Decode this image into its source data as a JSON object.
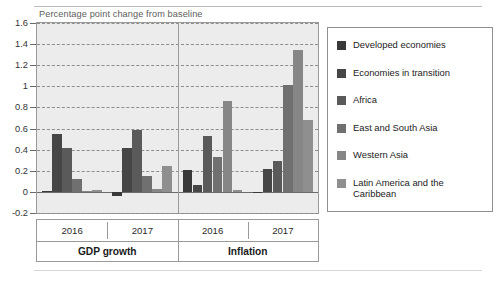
{
  "axis_title": "Percentage point change from baseline",
  "chart_data": {
    "type": "bar",
    "title": "Percentage point change from baseline",
    "xlabel": "",
    "ylabel": "Percentage point change from baseline",
    "ylim": [
      -0.2,
      1.6
    ],
    "ytick_values": [
      1.6,
      1.4,
      1.2,
      1,
      0.8,
      0.6,
      0.4,
      0.2,
      0,
      -0.2
    ],
    "ytick_labels": [
      "1.6",
      "1.4",
      "1.2",
      "1",
      "0.8",
      "0.6",
      "0.4",
      "0.2",
      "0",
      "-0.2"
    ],
    "grid": true,
    "legend_position": "right",
    "categories": [
      "GDP growth 2016",
      "GDP growth 2017",
      "Inflation 2016",
      "Inflation 2017"
    ],
    "major_groups": [
      {
        "label": "GDP growth",
        "years": [
          "2016",
          "2017"
        ]
      },
      {
        "label": "Inflation",
        "years": [
          "2016",
          "2017"
        ]
      }
    ],
    "series": [
      {
        "name": "Developed economies",
        "color": "#393939",
        "values": [
          0.01,
          -0.04,
          0.21,
          -0.01
        ]
      },
      {
        "name": "Economies in transition",
        "color": "#464646",
        "values": [
          0.55,
          0.42,
          0.07,
          0.22
        ]
      },
      {
        "name": "Africa",
        "color": "#5a5a5a",
        "values": [
          0.42,
          0.59,
          0.53,
          0.29
        ]
      },
      {
        "name": "East and South Asia",
        "color": "#707070",
        "values": [
          0.12,
          0.15,
          0.33,
          1.01
        ]
      },
      {
        "name": "Western Asia",
        "color": "#868686",
        "values": [
          0.01,
          0.03,
          0.86,
          1.34
        ]
      },
      {
        "name": "Latin America and the Caribbean",
        "color": "#8f8f8f",
        "values": [
          0.02,
          0.25,
          0.02,
          0.68
        ]
      }
    ]
  },
  "legend": {
    "items": [
      {
        "label": "Developed economies",
        "color": "#393939"
      },
      {
        "label": "Economies in transition",
        "color": "#464646"
      },
      {
        "label": "Africa",
        "color": "#5a5a5a"
      },
      {
        "label": "East and South Asia",
        "color": "#707070"
      },
      {
        "label": "Western Asia",
        "color": "#868686"
      },
      {
        "label": "Latin America and the\nCaribbean",
        "color": "#8f8f8f"
      }
    ]
  }
}
